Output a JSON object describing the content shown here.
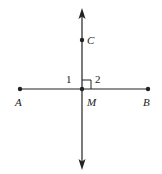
{
  "diagram": {
    "type": "geometry",
    "colors": {
      "stroke": "#222222",
      "background": "#ffffff"
    },
    "points": {
      "A": {
        "label": "A",
        "x": 20,
        "y": 89
      },
      "B": {
        "label": "B",
        "x": 148,
        "y": 89
      },
      "C": {
        "label": "C",
        "x": 82,
        "y": 40
      },
      "M": {
        "label": "M",
        "x": 82,
        "y": 89
      }
    },
    "angles": {
      "angle1": {
        "label": "1"
      },
      "angle2": {
        "label": "2",
        "right_angle_marker": true
      }
    },
    "lines": [
      {
        "name": "segment-AB",
        "from": "A",
        "to": "B",
        "arrows": false
      },
      {
        "name": "line-CM",
        "vertical": true,
        "arrows": "both"
      }
    ]
  }
}
